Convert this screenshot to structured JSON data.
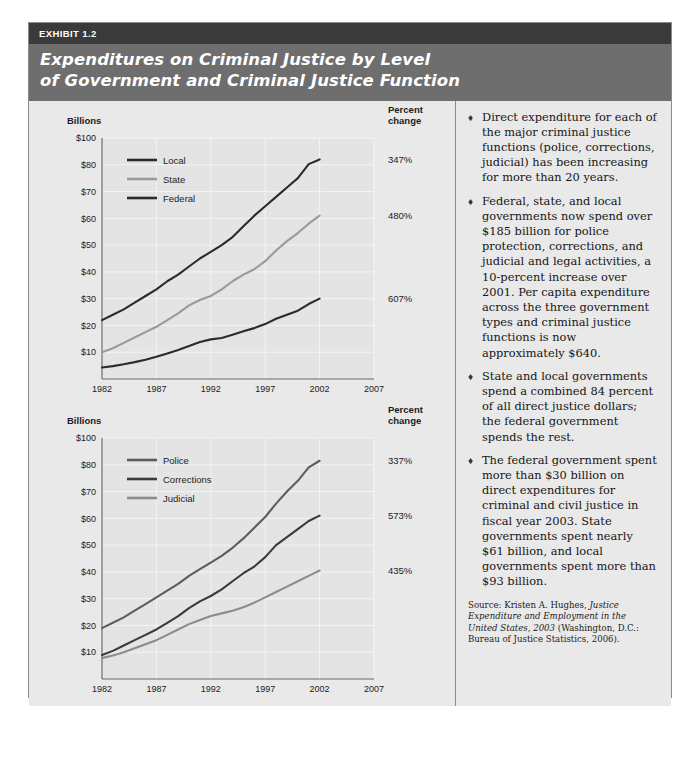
{
  "header": {
    "tag": "EXHIBIT 1.2",
    "title_line1": "Expenditures on Criminal Justice by Level",
    "title_line2": "of Government and Criminal Justice Function"
  },
  "axis": {
    "y_unit_label": "Billions",
    "y_ticks": [
      "$100",
      "$80",
      "$70",
      "$60",
      "$50",
      "$40",
      "$30",
      "$20",
      "$10"
    ],
    "x_ticks": [
      "1982",
      "1987",
      "1992",
      "1997",
      "2002",
      "2007"
    ],
    "x_title": "Year",
    "pct_header_line1": "Percent",
    "pct_header_line2": "change"
  },
  "colors": {
    "dark_line": "#2b2b2b",
    "mid_line": "#5d5d5d",
    "light_line": "#9a9a9a",
    "panel_bg": "#e9e9e9",
    "plot_bg": "#e4e4e4",
    "grid": "#f4f4f4",
    "header_tag_bg": "#3a3a3a",
    "header_title_bg": "#6e6e6e",
    "border": "#8c8c8c"
  },
  "chart_data": [
    {
      "type": "line",
      "title": "Expenditures on Criminal Justice by Level of Government",
      "xlabel": "Year",
      "ylabel": "Billions",
      "xlim": [
        1982,
        2007
      ],
      "ylim": [
        0,
        100
      ],
      "ytick_values": [
        100,
        80,
        70,
        60,
        50,
        40,
        30,
        20,
        10
      ],
      "ytick_labels": [
        "$100",
        "$80",
        "$70",
        "$60",
        "$50",
        "$40",
        "$30",
        "$20",
        "$10"
      ],
      "xtick_values": [
        1982,
        1987,
        1992,
        1997,
        2002,
        2007
      ],
      "grid": true,
      "legend_position": "upper-left",
      "x": [
        1982,
        1983,
        1984,
        1985,
        1986,
        1987,
        1988,
        1989,
        1990,
        1991,
        1992,
        1993,
        1994,
        1995,
        1996,
        1997,
        1998,
        1999,
        2000,
        2001,
        2002
      ],
      "series": [
        {
          "name": "Local",
          "color": "#2b2b2b",
          "percent_change": "347%",
          "values": [
            22.0,
            24.0,
            26.0,
            28.5,
            31.0,
            33.5,
            36.5,
            39.0,
            42.0,
            45.0,
            47.5,
            50.0,
            53.0,
            57.0,
            61.0,
            64.5,
            68.0,
            71.5,
            75.0,
            80.5,
            84.0
          ]
        },
        {
          "name": "State",
          "color": "#9a9a9a",
          "percent_change": "480%",
          "values": [
            10.0,
            11.5,
            13.5,
            15.5,
            17.5,
            19.5,
            22.0,
            24.5,
            27.5,
            29.5,
            31.0,
            33.5,
            36.5,
            39.0,
            41.0,
            44.0,
            48.0,
            51.5,
            54.5,
            58.0,
            61.0
          ]
        },
        {
          "name": "Federal",
          "color": "#2b2b2b",
          "percent_change": "607%",
          "values": [
            4.3,
            4.8,
            5.5,
            6.3,
            7.2,
            8.3,
            9.5,
            10.8,
            12.3,
            13.8,
            14.8,
            15.3,
            16.5,
            17.8,
            19.0,
            20.5,
            22.5,
            24.0,
            25.5,
            28.0,
            30.0
          ]
        }
      ]
    },
    {
      "type": "line",
      "title": "Expenditures on Criminal Justice by Function",
      "xlabel": "Year",
      "ylabel": "Billions",
      "xlim": [
        1982,
        2007
      ],
      "ylim": [
        0,
        100
      ],
      "ytick_values": [
        100,
        80,
        70,
        60,
        50,
        40,
        30,
        20,
        10
      ],
      "ytick_labels": [
        "$100",
        "$80",
        "$70",
        "$60",
        "$50",
        "$40",
        "$30",
        "$20",
        "$10"
      ],
      "xtick_values": [
        1982,
        1987,
        1992,
        1997,
        2002,
        2007
      ],
      "grid": true,
      "legend_position": "upper-left",
      "x": [
        1982,
        1983,
        1984,
        1985,
        1986,
        1987,
        1988,
        1989,
        1990,
        1991,
        1992,
        1993,
        1994,
        1995,
        1996,
        1997,
        1998,
        1999,
        2000,
        2001,
        2002
      ],
      "series": [
        {
          "name": "Police",
          "color": "#5d5d5d",
          "percent_change": "337%",
          "values": [
            19.0,
            21.0,
            23.0,
            25.5,
            28.0,
            30.5,
            33.0,
            35.5,
            38.5,
            41.0,
            43.5,
            46.0,
            49.0,
            52.5,
            56.5,
            60.5,
            65.5,
            70.0,
            74.0,
            79.0,
            83.0
          ]
        },
        {
          "name": "Corrections",
          "color": "#3a3a3a",
          "percent_change": "573%",
          "values": [
            9.0,
            10.5,
            12.5,
            14.5,
            16.5,
            18.5,
            21.0,
            23.5,
            26.5,
            29.0,
            31.0,
            33.5,
            36.5,
            39.5,
            42.0,
            45.5,
            50.0,
            53.0,
            56.0,
            59.0,
            61.0
          ]
        },
        {
          "name": "Judicial",
          "color": "#8c8c8c",
          "percent_change": "435%",
          "values": [
            7.8,
            8.8,
            10.0,
            11.5,
            13.0,
            14.5,
            16.5,
            18.5,
            20.5,
            22.0,
            23.5,
            24.5,
            25.5,
            26.8,
            28.5,
            30.5,
            32.5,
            34.5,
            36.5,
            38.5,
            40.5
          ]
        }
      ]
    }
  ],
  "sidebar": {
    "bullet_glyph": "♦",
    "bullets": [
      "Direct expenditure for each of the major criminal justice functions (police, corrections, judicial) has been increasing for more than 20 years.",
      "Federal, state, and local governments now spend over $185 billion for police protection, corrections, and judicial and legal activities, a 10-percent increase over 2001. Per capita expenditure across the three government types and criminal justice functions is now approximately $640.",
      "State and local governments spend a combined 84 percent of all direct justice dollars; the federal government spends the rest.",
      "The federal government spent more than $30 billion on direct expenditures for criminal and civil justice in fiscal year 2003. State governments spent nearly $61 billion, and local governments spent more than $93 billion."
    ],
    "source": {
      "prefix": "Source: Kristen A. Hughes, ",
      "italic": "Justice Expenditure and Employment in the United States, 2003",
      "suffix": " (Washington, D.C.: Bureau of Justice Statistics, 2006)."
    }
  }
}
